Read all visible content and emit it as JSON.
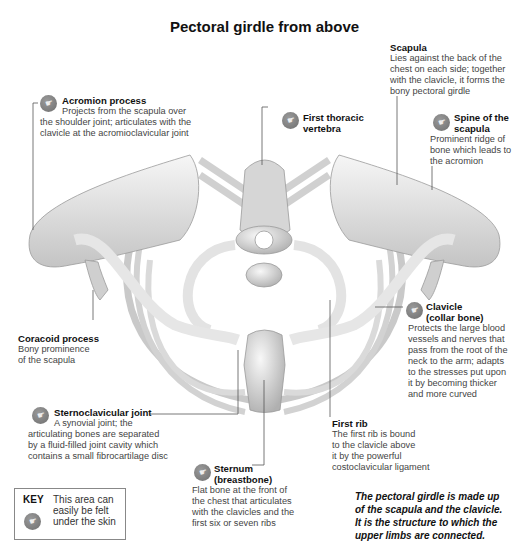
{
  "title": "Pectoral girdle from above",
  "labels": {
    "scapula": {
      "heading": "Scapula",
      "lines": [
        "Lies against the back of the",
        "chest on each side; together",
        "with the clavicle, it forms the",
        "bony pectoral girdle"
      ],
      "palpable": false
    },
    "acromion": {
      "heading": "Acromion process",
      "lines": [
        "Projects from the scapula over",
        "the shoulder joint; articulates with the",
        "clavicle at the acromioclavicular joint"
      ],
      "palpable": true
    },
    "first_thoracic": {
      "heading_lines": [
        "First thoracic",
        "vertebra"
      ],
      "palpable": true
    },
    "spine_scapula": {
      "heading_lines": [
        "Spine of the",
        "scapula"
      ],
      "lines": [
        "Prominent ridge of",
        "bone which leads to",
        "the acromion"
      ],
      "palpable": true
    },
    "coracoid": {
      "heading": "Coracoid process",
      "lines": [
        "Bony prominence",
        "of the scapula"
      ],
      "palpable": false
    },
    "clavicle": {
      "heading_lines": [
        "Clavicle",
        "(collar bone)"
      ],
      "lines": [
        "Protects the large blood",
        "vessels and nerves that",
        "pass from the root of the",
        "neck to the arm; adapts",
        "to the stresses put upon",
        "it by becoming thicker",
        "and more curved"
      ],
      "palpable": true
    },
    "sternoclavicular": {
      "heading": "Sternoclavicular joint",
      "lines": [
        "A synovial joint; the",
        "articulating bones are separated",
        "by a fluid-filled joint cavity which",
        "contains a small fibrocartilage disc"
      ],
      "palpable": true
    },
    "first_rib": {
      "heading": "First rib",
      "lines": [
        "The first rib is bound",
        "to the clavicle above",
        "it by the powerful",
        "costoclavicular ligament"
      ],
      "palpable": false
    },
    "sternum": {
      "heading_lines": [
        "Sternum",
        "(breastbone)"
      ],
      "lines": [
        "Flat bone at the front of",
        "the chest that articulates",
        "with the clavicles and the",
        "first six or seven ribs"
      ],
      "palpable": true
    }
  },
  "key": {
    "title": "KEY",
    "lines": [
      "This area can",
      "easily be felt",
      "under the skin"
    ],
    "icon": "palpable-hand-icon"
  },
  "summary": [
    "The pectoral girdle is made up",
    "of the scapula and the clavicle.",
    "It is the structure to which the",
    "upper limbs are connected."
  ],
  "icon_glyph": "☛",
  "colors": {
    "bone_light": "#f2f2f2",
    "bone_shade": "#b8b8b8",
    "line": "#555555",
    "icon": "#7a7a7a"
  }
}
